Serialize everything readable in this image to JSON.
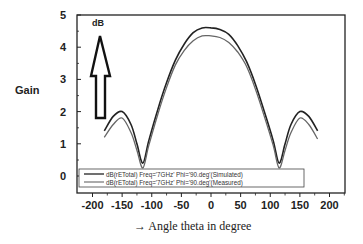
{
  "chart_data": {
    "type": "line",
    "title": "",
    "xlabel": "→ Angle theta in degree",
    "ylabel": "Gain",
    "y_unit_annotation": "dB",
    "xlim": [
      -225,
      225
    ],
    "ylim": [
      -0.55,
      5
    ],
    "xticks": [
      -200,
      -150,
      -100,
      -50,
      0,
      50,
      100,
      150,
      200
    ],
    "yticks": [
      0,
      1,
      2,
      3,
      4,
      5
    ],
    "grid": false,
    "legend_position": "lower-left inside",
    "x": [
      -180,
      -165,
      -150,
      -135,
      -125,
      -115,
      -105,
      -90,
      -75,
      -60,
      -45,
      -30,
      -15,
      0,
      15,
      30,
      45,
      60,
      75,
      90,
      105,
      115,
      125,
      135,
      150,
      165,
      180
    ],
    "series": [
      {
        "name": "dB(rETotal) Freq='7GHz' Phi='90.deg'(Simulated)",
        "color": "#222222",
        "values": [
          1.4,
          1.85,
          2.0,
          1.6,
          1.0,
          0.4,
          1.1,
          2.05,
          2.9,
          3.6,
          4.1,
          4.45,
          4.6,
          4.6,
          4.55,
          4.4,
          4.05,
          3.55,
          2.85,
          2.0,
          1.1,
          0.4,
          1.0,
          1.6,
          2.0,
          1.85,
          1.4
        ]
      },
      {
        "name": "dB(rETotal) Freq='7GHz' Phi='90.deg'(Measured)",
        "color": "#666666",
        "values": [
          1.2,
          1.6,
          1.8,
          1.35,
          0.8,
          0.25,
          0.95,
          1.9,
          2.75,
          3.45,
          3.9,
          4.2,
          4.35,
          4.35,
          4.3,
          4.15,
          3.85,
          3.4,
          2.7,
          1.85,
          0.95,
          0.25,
          0.8,
          1.35,
          1.8,
          1.6,
          1.15
        ]
      }
    ]
  },
  "labels": {
    "ylabel": "Gain",
    "unit": "dB",
    "xlabel": "→ Angle theta in degree"
  },
  "legend": [
    "dB(rETotal) Freq='7GHz' Phi='90.deg'(Simulated)",
    "dB(rETotal) Freq='7GHz' Phi='90.deg'(Measured)"
  ]
}
